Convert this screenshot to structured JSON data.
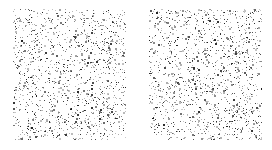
{
  "figure": {
    "type": "two-panel random point pattern comparison",
    "background_color": "#ffffff",
    "width": 272,
    "height": 150,
    "title": "",
    "caption": "",
    "has_axes": false,
    "has_gridlines": false,
    "has_legend": false,
    "has_tick_labels": false,
    "has_border": false
  },
  "chart_data": {
    "type": "scatter",
    "title": "",
    "xlabel": "",
    "ylabel": "",
    "grid": false,
    "legend_position": "none",
    "axes_visible": false,
    "tick_labels": [],
    "annotations": [],
    "panel_layout": {
      "rows": 1,
      "cols": 2,
      "gap_px": 23
    },
    "marker": {
      "shape": "square",
      "size_px": 1,
      "size_range_px": [
        1,
        2
      ],
      "color_min": "#c8c8c8",
      "color_max": "#1a1a1a",
      "colormap": "grayscale"
    },
    "panels": [
      {
        "name": "panel-a",
        "label": "",
        "x_px": 13,
        "y_px": 9,
        "width_px": 113,
        "height_px": 131,
        "xlim": [
          0,
          113
        ],
        "ylim": [
          0,
          131
        ],
        "n_points": 1380,
        "distribution": "uniform-random",
        "fill_density_pct": 8.2,
        "seed": 1733
      },
      {
        "name": "panel-b",
        "label": "",
        "x_px": 149,
        "y_px": 9,
        "width_px": 113,
        "height_px": 131,
        "xlim": [
          0,
          113
        ],
        "ylim": [
          0,
          131
        ],
        "n_points": 1395,
        "distribution": "uniform-random",
        "fill_density_pct": 8.3,
        "seed": 90210
      }
    ]
  }
}
